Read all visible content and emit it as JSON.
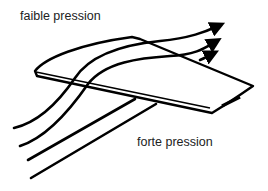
{
  "diagram": {
    "labels": {
      "low_pressure": "faible pression",
      "high_pressure": "forte pression"
    },
    "elements": {
      "wing": "wing-shape",
      "streamlines_count": 4,
      "arrows_count": 3
    },
    "colors": {
      "stroke": "#000000",
      "text": "#222222",
      "background": "#ffffff"
    }
  }
}
